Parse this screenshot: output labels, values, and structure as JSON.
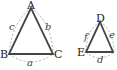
{
  "triangle_abc": {
    "vertices": {
      "A": "A",
      "B": "B",
      "C": "C"
    },
    "sides": {
      "a": "a",
      "b": "b",
      "c": "c"
    }
  },
  "triangle_def": {
    "vertices": {
      "D": "D",
      "E": "E"
    },
    "sides": {
      "d": "d",
      "e": "e",
      "f": "f"
    }
  },
  "colors": {
    "edge": "#444444",
    "arc": "#999999"
  }
}
